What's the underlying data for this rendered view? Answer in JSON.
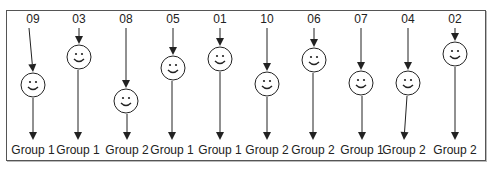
{
  "diagram": {
    "items": [
      {
        "id": "09",
        "group": "Group 1",
        "x": 33,
        "face_y": 85,
        "end_x": 33
      },
      {
        "id": "03",
        "group": "Group 1",
        "x": 79,
        "face_y": 57,
        "end_x": 78
      },
      {
        "id": "08",
        "group": "Group 2",
        "x": 126,
        "face_y": 101,
        "end_x": 127
      },
      {
        "id": "05",
        "group": "Group 1",
        "x": 173,
        "face_y": 68,
        "end_x": 172
      },
      {
        "id": "01",
        "group": "Group 1",
        "x": 220,
        "face_y": 59,
        "end_x": 220
      },
      {
        "id": "10",
        "group": "Group 2",
        "x": 267,
        "face_y": 84,
        "end_x": 267
      },
      {
        "id": "06",
        "group": "Group 2",
        "x": 314,
        "face_y": 60,
        "end_x": 313
      },
      {
        "id": "07",
        "group": "Group 1",
        "x": 361,
        "face_y": 83,
        "end_x": 362
      },
      {
        "id": "04",
        "group": "Group 2",
        "x": 408,
        "face_y": 83,
        "end_x": 404
      },
      {
        "id": "02",
        "group": "Group 2",
        "x": 455,
        "face_y": 54,
        "end_x": 455
      }
    ],
    "colors": {
      "line": "#222222",
      "face": "#ffffff",
      "frame": "#555555"
    }
  }
}
